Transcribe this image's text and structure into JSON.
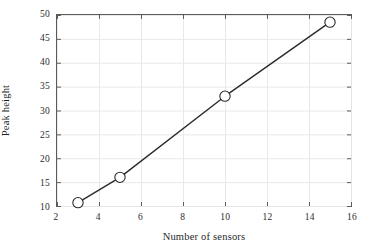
{
  "chart_data": {
    "type": "line",
    "title": "",
    "xlabel": "Number of sensors",
    "ylabel": "Peak height",
    "xlim": [
      2,
      16
    ],
    "ylim": [
      10,
      50
    ],
    "xticks": [
      "2",
      "4",
      "6",
      "8",
      "10",
      "12",
      "14",
      "16"
    ],
    "yticks": [
      "10",
      "15",
      "20",
      "25",
      "30",
      "35",
      "40",
      "45",
      "50"
    ],
    "xtick_values": [
      2,
      4,
      6,
      8,
      10,
      12,
      14,
      16
    ],
    "ytick_values": [
      10,
      15,
      20,
      25,
      30,
      35,
      40,
      45,
      50
    ],
    "grid": true,
    "legend": null,
    "series": [
      {
        "name": "Peak height",
        "marker": "open-circle",
        "line_color": "#2b2b2b",
        "marker_color": "#2b2b2b",
        "x": [
          3,
          5,
          10,
          15
        ],
        "y": [
          10.7,
          16.0,
          33.0,
          48.5
        ]
      }
    ]
  },
  "style": {
    "axis_color": "#5a5a5a",
    "grid_color": "#e8e8e8",
    "line_color": "#2b2b2b",
    "marker_face": "#ffffff",
    "background": "#ffffff",
    "text_color": "#1f1f1f"
  }
}
